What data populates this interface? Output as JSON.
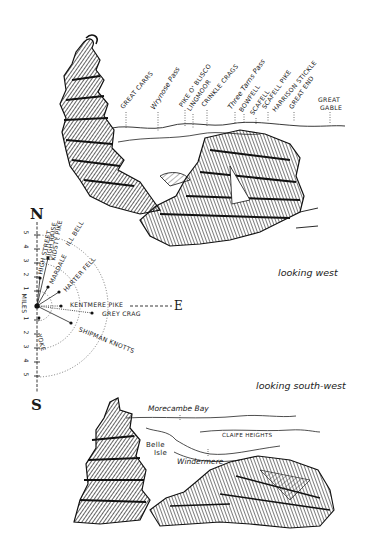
{
  "view_west": {
    "caption": "looking west",
    "peaks": [
      {
        "label": "GREAT CARRS",
        "x": 126,
        "y": 110
      },
      {
        "label": "Wrynose Pass",
        "x": 159,
        "y": 110
      },
      {
        "label": "PIKE O' BLISCO",
        "x": 185,
        "y": 108
      },
      {
        "label": "LINGMOOR",
        "x": 193,
        "y": 112
      },
      {
        "label": "CRINKLE CRAGS",
        "x": 207,
        "y": 108
      },
      {
        "label": "Three Tarns Pass",
        "x": 235,
        "y": 110
      },
      {
        "label": "BOWFELL",
        "x": 245,
        "y": 113
      },
      {
        "label": "SCAFELL",
        "x": 256,
        "y": 116
      },
      {
        "label": "SCAFELL PIKE",
        "x": 268,
        "y": 110
      },
      {
        "label": "HARRISON STICKLE",
        "x": 278,
        "y": 113
      },
      {
        "label": "GREAT END",
        "x": 295,
        "y": 110
      }
    ],
    "great_gable": {
      "line1": "GREAT",
      "line2": "GABLE"
    }
  },
  "compass": {
    "north": "N",
    "south": "S",
    "east": "E",
    "scale_label": "MILES",
    "scale_north": [
      "5",
      "4",
      "3",
      "2",
      "1"
    ],
    "scale_south": [
      "1",
      "2",
      "3",
      "4",
      "5"
    ],
    "fells": [
      {
        "label": "HIGH STREET"
      },
      {
        "label": "HIGH RAISE"
      },
      {
        "label": "KIDSTY PIKE"
      },
      {
        "label": "ILL BELL"
      },
      {
        "label": "MARDALE"
      },
      {
        "label": "HARTER FELL"
      },
      {
        "label": "KENTMERE PIKE"
      },
      {
        "label": "GREY CRAG"
      },
      {
        "label": "SHIPMAN KNOTTS"
      },
      {
        "label": "YOKE"
      }
    ]
  },
  "view_southwest": {
    "caption": "looking south-west",
    "labels": {
      "bay": "Morecambe Bay",
      "heights": "CLAIFE HEIGHTS",
      "isle_1": "Belle",
      "isle_2": "Isle",
      "lake": "Windermere"
    }
  }
}
